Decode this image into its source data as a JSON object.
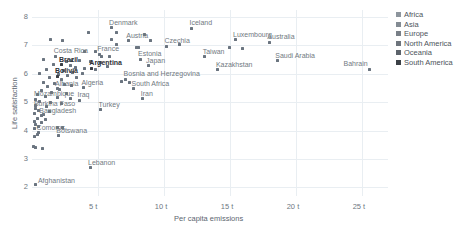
{
  "chart_data": {
    "type": "scatter",
    "title": "",
    "xlabel": "Per capita emissions",
    "ylabel": "Life satisfaction",
    "xlim": [
      0,
      27
    ],
    "ylim": [
      1.7,
      8.25
    ],
    "xticks": [
      "5 t",
      "10 t",
      "15 t",
      "20 t",
      "25 t"
    ],
    "xtickvals": [
      5,
      10,
      15,
      20,
      25
    ],
    "yticks": [
      "2",
      "3",
      "4",
      "5",
      "6",
      "7",
      "8"
    ],
    "ytickvals": [
      2,
      3,
      4,
      5,
      6,
      7,
      8
    ],
    "grid": true,
    "legend_position": "right",
    "legend": [
      {
        "label": "Africa",
        "color": "#8d959d"
      },
      {
        "label": "Asia",
        "color": "#838b93"
      },
      {
        "label": "Europe",
        "color": "#787f87"
      },
      {
        "label": "North America",
        "color": "#6d747c"
      },
      {
        "label": "Oceania",
        "color": "#5c636b"
      },
      {
        "label": "South America",
        "color": "#3b4046"
      }
    ],
    "points": [
      {
        "label": "Denmark",
        "x": 6.0,
        "y": 7.62,
        "emphasis": "mid",
        "lx": -2,
        "ly": -9
      },
      {
        "label": "Iceland",
        "x": 12.1,
        "y": 7.6,
        "emphasis": "mid",
        "lx": -2,
        "ly": -9
      },
      {
        "label": "Luxembourg",
        "x": 15.4,
        "y": 7.2,
        "emphasis": "mid",
        "lx": -2,
        "ly": -9
      },
      {
        "label": "Austria",
        "x": 7.3,
        "y": 7.16,
        "emphasis": "mid",
        "lx": -2,
        "ly": -9
      },
      {
        "label": "Australia",
        "x": 18.0,
        "y": 7.12,
        "emphasis": "mid",
        "lx": -2,
        "ly": -9
      },
      {
        "label": "Czechia",
        "x": 10.2,
        "y": 6.97,
        "emphasis": "mid",
        "lx": -2,
        "ly": -9
      },
      {
        "label": "France",
        "x": 5.1,
        "y": 6.69,
        "emphasis": "mid",
        "lx": -2,
        "ly": -9
      },
      {
        "label": "Costa Rica",
        "x": 1.8,
        "y": 6.62,
        "emphasis": "mid",
        "lx": -2,
        "ly": -9
      },
      {
        "label": "Taiwan",
        "x": 13.1,
        "y": 6.6,
        "emphasis": "mid",
        "lx": -2,
        "ly": -9
      },
      {
        "label": "Estonia",
        "x": 8.2,
        "y": 6.52,
        "emphasis": "mid",
        "lx": -2,
        "ly": -9
      },
      {
        "label": "Saudi Arabia",
        "x": 18.6,
        "y": 6.46,
        "emphasis": "mid",
        "lx": -2,
        "ly": -9
      },
      {
        "label": "Brazil",
        "x": 2.2,
        "y": 6.32,
        "emphasis": "strong",
        "lx": -2,
        "ly": -9
      },
      {
        "label": "Japan",
        "x": 8.8,
        "y": 6.28,
        "emphasis": "mid",
        "lx": -2,
        "ly": -9
      },
      {
        "label": "Argentina",
        "x": 4.5,
        "y": 6.2,
        "emphasis": "strong",
        "lx": -2,
        "ly": -9
      },
      {
        "label": "Bahrain",
        "x": 25.6,
        "y": 6.17,
        "emphasis": "mid",
        "lx": -26,
        "ly": -9
      },
      {
        "label": "Kazakhstan",
        "x": 14.1,
        "y": 6.14,
        "emphasis": "mid",
        "lx": -2,
        "ly": -9
      },
      {
        "label": "Bolivia",
        "x": 1.9,
        "y": 5.92,
        "emphasis": "strong",
        "lx": -2,
        "ly": -9
      },
      {
        "label": "Bosnia and Herzegovina",
        "x": 7.1,
        "y": 5.82,
        "emphasis": "mid",
        "lx": -2,
        "ly": -9
      },
      {
        "label": "Albania",
        "x": 1.9,
        "y": 5.48,
        "emphasis": "mid",
        "lx": -2,
        "ly": -9
      },
      {
        "label": "Algeria",
        "x": 3.9,
        "y": 5.52,
        "emphasis": "mid",
        "lx": -2,
        "ly": -9
      },
      {
        "label": "South Africa",
        "x": 7.7,
        "y": 5.48,
        "emphasis": "mid",
        "lx": -2,
        "ly": -9
      },
      {
        "label": "Mozambique",
        "x": 0.3,
        "y": 5.1,
        "emphasis": "mid",
        "lx": -2,
        "ly": -9
      },
      {
        "label": "Iraq",
        "x": 3.6,
        "y": 5.08,
        "emphasis": "mid",
        "lx": -2,
        "ly": -9
      },
      {
        "label": "Iran",
        "x": 8.4,
        "y": 5.12,
        "emphasis": "mid",
        "lx": -2,
        "ly": -9
      },
      {
        "label": "Burkina Faso",
        "x": 0.3,
        "y": 4.78,
        "emphasis": "mid",
        "lx": -2,
        "ly": -9
      },
      {
        "label": "Turkey",
        "x": 5.2,
        "y": 4.74,
        "emphasis": "mid",
        "lx": -2,
        "ly": -9
      },
      {
        "label": "Bangladesh",
        "x": 0.7,
        "y": 4.52,
        "emphasis": "mid",
        "lx": -2,
        "ly": -9
      },
      {
        "label": "Comoros",
        "x": 0.5,
        "y": 3.92,
        "emphasis": "mid",
        "lx": -2,
        "ly": -9
      },
      {
        "label": "Botswana",
        "x": 2.0,
        "y": 3.82,
        "emphasis": "mid",
        "lx": -2,
        "ly": -9
      },
      {
        "label": "Lebanon",
        "x": 4.4,
        "y": 2.7,
        "emphasis": "mid",
        "lx": -2,
        "ly": -9
      },
      {
        "label": "Afghanistan",
        "x": 0.3,
        "y": 2.1,
        "emphasis": "mid",
        "lx": 2,
        "ly": -8
      }
    ],
    "unlabeled_points": [
      {
        "x": 4.3,
        "y": 7.45
      },
      {
        "x": 6.4,
        "y": 7.45
      },
      {
        "x": 1.4,
        "y": 7.22
      },
      {
        "x": 2.3,
        "y": 7.18
      },
      {
        "x": 6.0,
        "y": 7.22
      },
      {
        "x": 8.5,
        "y": 7.38
      },
      {
        "x": 9.0,
        "y": 7.18
      },
      {
        "x": 6.4,
        "y": 7.02
      },
      {
        "x": 11.2,
        "y": 7.05
      },
      {
        "x": 7.9,
        "y": 6.92
      },
      {
        "x": 8.1,
        "y": 6.92
      },
      {
        "x": 15.0,
        "y": 6.93
      },
      {
        "x": 16.0,
        "y": 6.9
      },
      {
        "x": 4.0,
        "y": 6.8
      },
      {
        "x": 4.8,
        "y": 6.78
      },
      {
        "x": 5.3,
        "y": 6.62
      },
      {
        "x": 5.9,
        "y": 6.6
      },
      {
        "x": 0.9,
        "y": 6.52
      },
      {
        "x": 3.0,
        "y": 6.48
      },
      {
        "x": 3.6,
        "y": 6.46
      },
      {
        "x": 4.4,
        "y": 6.44
      },
      {
        "x": 2.6,
        "y": 6.42
      },
      {
        "x": 5.2,
        "y": 6.4
      },
      {
        "x": 1.6,
        "y": 6.34
      },
      {
        "x": 2.9,
        "y": 6.3
      },
      {
        "x": 5.7,
        "y": 6.26
      },
      {
        "x": 3.3,
        "y": 6.22
      },
      {
        "x": 4.0,
        "y": 6.18
      },
      {
        "x": 4.8,
        "y": 6.16
      },
      {
        "x": 1.1,
        "y": 6.14
      },
      {
        "x": 2.4,
        "y": 6.12
      },
      {
        "x": 3.1,
        "y": 6.06
      },
      {
        "x": 3.8,
        "y": 6.02
      },
      {
        "x": 0.6,
        "y": 6.0
      },
      {
        "x": 2.0,
        "y": 5.98
      },
      {
        "x": 2.7,
        "y": 5.94
      },
      {
        "x": 1.3,
        "y": 5.88
      },
      {
        "x": 3.4,
        "y": 5.86
      },
      {
        "x": 2.2,
        "y": 5.8
      },
      {
        "x": 6.8,
        "y": 5.72
      },
      {
        "x": 7.4,
        "y": 5.68
      },
      {
        "x": 0.9,
        "y": 5.7
      },
      {
        "x": 1.7,
        "y": 5.66
      },
      {
        "x": 2.5,
        "y": 5.62
      },
      {
        "x": 3.0,
        "y": 5.58
      },
      {
        "x": 1.2,
        "y": 5.54
      },
      {
        "x": 2.1,
        "y": 5.44
      },
      {
        "x": 0.7,
        "y": 5.4
      },
      {
        "x": 1.5,
        "y": 5.36
      },
      {
        "x": 2.6,
        "y": 5.3
      },
      {
        "x": 0.4,
        "y": 5.26
      },
      {
        "x": 1.0,
        "y": 5.22
      },
      {
        "x": 1.9,
        "y": 5.18
      },
      {
        "x": 2.9,
        "y": 5.14
      },
      {
        "x": 0.6,
        "y": 5.02
      },
      {
        "x": 1.4,
        "y": 4.98
      },
      {
        "x": 2.2,
        "y": 4.94
      },
      {
        "x": 0.3,
        "y": 4.9
      },
      {
        "x": 1.1,
        "y": 4.86
      },
      {
        "x": 0.5,
        "y": 4.7
      },
      {
        "x": 1.3,
        "y": 4.66
      },
      {
        "x": 0.2,
        "y": 4.62
      },
      {
        "x": 0.9,
        "y": 4.56
      },
      {
        "x": 0.4,
        "y": 4.44
      },
      {
        "x": 1.0,
        "y": 4.4
      },
      {
        "x": 0.2,
        "y": 4.34
      },
      {
        "x": 0.7,
        "y": 4.28
      },
      {
        "x": 0.3,
        "y": 4.22
      },
      {
        "x": 0.5,
        "y": 4.14
      },
      {
        "x": 0.2,
        "y": 4.08
      },
      {
        "x": 1.9,
        "y": 4.12
      },
      {
        "x": 2.3,
        "y": 4.1
      },
      {
        "x": 0.4,
        "y": 3.86
      },
      {
        "x": 0.2,
        "y": 3.78
      },
      {
        "x": 0.3,
        "y": 3.4
      },
      {
        "x": 0.8,
        "y": 3.38
      },
      {
        "x": 0.15,
        "y": 3.44
      }
    ]
  }
}
